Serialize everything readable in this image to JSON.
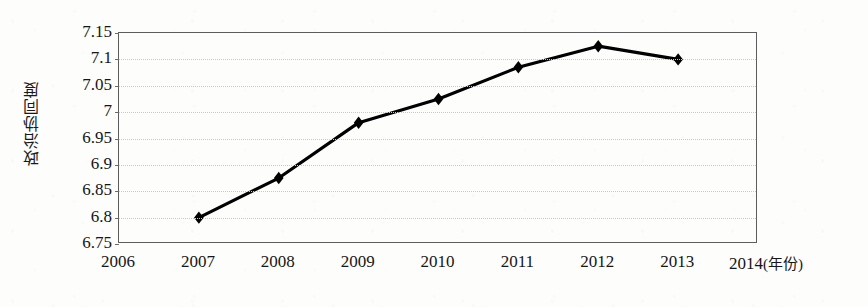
{
  "chart_data": {
    "type": "line",
    "title": "",
    "xlabel": "年份",
    "ylabel": "政治协同度",
    "x": [
      2007,
      2008,
      2009,
      2010,
      2011,
      2012,
      2013
    ],
    "values": [
      6.8,
      6.875,
      6.98,
      7.025,
      7.085,
      7.125,
      7.1
    ],
    "series": [
      {
        "name": "政治协同度",
        "values": [
          6.8,
          6.875,
          6.98,
          7.025,
          7.085,
          7.125,
          7.1
        ]
      }
    ],
    "xlim": [
      2006,
      2014
    ],
    "ylim": [
      6.75,
      7.15
    ],
    "x_ticks": [
      "2006",
      "2007",
      "2008",
      "2009",
      "2010",
      "2011",
      "2012",
      "2013",
      "2014"
    ],
    "x_tick_values": [
      2006,
      2007,
      2008,
      2009,
      2010,
      2011,
      2012,
      2013,
      2014
    ],
    "y_ticks": [
      "7.15",
      "7.1",
      "7.05",
      "7",
      "6.95",
      "6.9",
      "6.85",
      "6.8",
      "6.75"
    ],
    "y_tick_values": [
      7.15,
      7.1,
      7.05,
      7.0,
      6.95,
      6.9,
      6.85,
      6.8,
      6.75
    ],
    "grid": true,
    "legend": false,
    "legend_position": "none",
    "marker": "diamond",
    "line_color": "#000000",
    "marker_color": "#000000",
    "grid_color": "#c9c9c9",
    "axis_color": "#5d5d5d",
    "x_unit_label": "(年份)",
    "x_unit_anchor": 2014
  }
}
